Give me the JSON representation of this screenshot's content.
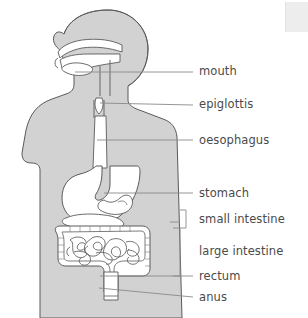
{
  "diagram": {
    "type": "labelled-anatomical-diagram",
    "background_color": "#ffffff",
    "body_fill_color": "#d2d2d2",
    "organ_fill_color": "#ffffff",
    "outline_color": "#5a5a5a",
    "leader_line_color": "#8a8a8a",
    "label_text_color": "#4a4a4a"
  },
  "labels": [
    {
      "id": "mouth",
      "text": "mouth",
      "x": 199,
      "y": 66
    },
    {
      "id": "epiglottis",
      "text": "epiglottis",
      "x": 199,
      "y": 99
    },
    {
      "id": "oesophagus",
      "text": "oesophagus",
      "x": 199,
      "y": 135
    },
    {
      "id": "stomach",
      "text": "stomach",
      "x": 199,
      "y": 188
    },
    {
      "id": "small-intestine",
      "text": "small intestine",
      "x": 199,
      "y": 214
    },
    {
      "id": "large-intestine",
      "text": "large intestine",
      "x": 199,
      "y": 246
    },
    {
      "id": "rectum",
      "text": "rectum",
      "x": 199,
      "y": 271
    },
    {
      "id": "anus",
      "text": "anus",
      "x": 199,
      "y": 292
    }
  ],
  "leader_lines": [
    {
      "id": "mouth",
      "x1": 75,
      "y1": 72,
      "x2": 193,
      "y2": 72
    },
    {
      "id": "epiglottis",
      "x1": 100,
      "y1": 103,
      "x2": 193,
      "y2": 105
    },
    {
      "id": "oesophagus",
      "x1": 97,
      "y1": 140,
      "x2": 193,
      "y2": 140
    },
    {
      "id": "stomach",
      "x1": 104,
      "y1": 193,
      "x2": 193,
      "y2": 193
    },
    {
      "id": "rectum",
      "x1": 100,
      "y1": 276,
      "x2": 193,
      "y2": 276
    },
    {
      "id": "anus",
      "x1": 99,
      "y1": 288,
      "x2": 193,
      "y2": 297
    }
  ],
  "brackets": [
    {
      "id": "small-intestine-bracket",
      "top": 210,
      "bottom": 228,
      "x": 186,
      "tick_x": 172,
      "tick_y": 222
    },
    {
      "id": "large-intestine-bracket",
      "top": 228,
      "bottom": 276,
      "x": 180,
      "arm": 7
    }
  ],
  "organs": [
    "mouth",
    "epiglottis",
    "oesophagus",
    "stomach",
    "small intestine",
    "large intestine",
    "rectum",
    "anus"
  ]
}
